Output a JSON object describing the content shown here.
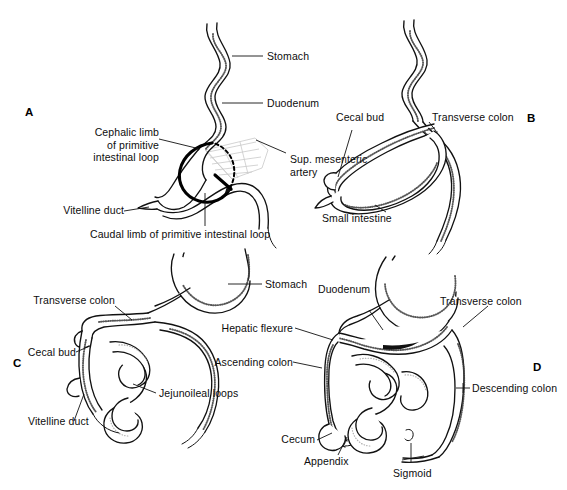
{
  "figure": {
    "background_color": "#ffffff",
    "ink_color": "#111111"
  },
  "panels": [
    {
      "id": "A",
      "letter": "A",
      "labels": [
        {
          "name": "stomach",
          "text": "Stomach"
        },
        {
          "name": "duodenum",
          "text": "Duodenum"
        },
        {
          "name": "cephalic-limb",
          "text": "Cephalic limb\nof primitive\nintestinal loop"
        },
        {
          "name": "sup-mesenteric-artery",
          "text": "Sup. mesenteric\nartery"
        },
        {
          "name": "vitelline-duct",
          "text": "Vitelline duct"
        },
        {
          "name": "caudal-limb",
          "text": "Caudal limb of primitive intestinal loop"
        }
      ]
    },
    {
      "id": "B",
      "letter": "B",
      "labels": [
        {
          "name": "cecal-bud",
          "text": "Cecal bud"
        },
        {
          "name": "transverse-colon",
          "text": "Transverse colon"
        },
        {
          "name": "small-intestine",
          "text": "Small intestine"
        }
      ]
    },
    {
      "id": "C",
      "letter": "C",
      "labels": [
        {
          "name": "stomach",
          "text": "Stomach"
        },
        {
          "name": "transverse-colon",
          "text": "Transverse colon"
        },
        {
          "name": "cecal-bud",
          "text": "Cecal bud"
        },
        {
          "name": "jejunoileal-loops",
          "text": "Jejunoileal loops"
        },
        {
          "name": "vitelline-duct",
          "text": "Vitelline duct"
        }
      ]
    },
    {
      "id": "D",
      "letter": "D",
      "labels": [
        {
          "name": "duodenum",
          "text": "Duodenum"
        },
        {
          "name": "transverse-colon",
          "text": "Transverse colon"
        },
        {
          "name": "hepatic-flexure",
          "text": "Hepatic flexure"
        },
        {
          "name": "ascending-colon",
          "text": "Ascending colon"
        },
        {
          "name": "descending-colon",
          "text": "Descending colon"
        },
        {
          "name": "cecum",
          "text": "Cecum"
        },
        {
          "name": "appendix",
          "text": "Appendix"
        },
        {
          "name": "sigmoid",
          "text": "Sigmoid"
        }
      ]
    }
  ]
}
